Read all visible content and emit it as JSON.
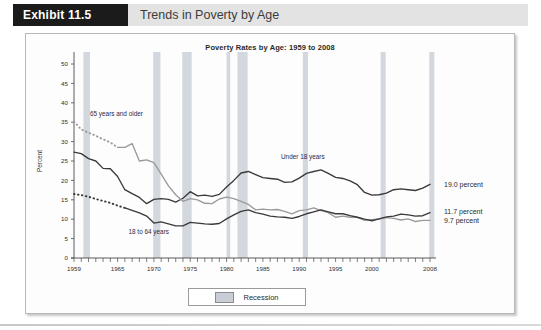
{
  "exhibit": {
    "badge": "Exhibit 11.5",
    "title": "Trends in Poverty by Age"
  },
  "legend": {
    "recession_label": "Recession",
    "swatch_name": "recession-swatch"
  },
  "annotations": {
    "under18": "Under 18 years",
    "age65": "65 years and older",
    "age18to64": "18 to 64 years",
    "value_under18": "19.0 percent",
    "value_18to64": "11.7 percent",
    "value_65plus": "9.7 percent"
  },
  "chart_data": {
    "type": "line",
    "title": "Poverty Rates by Age: 1959 to 2008",
    "xlabel": "",
    "ylabel": "Percent",
    "xlim": [
      1959,
      2008
    ],
    "ylim": [
      0,
      50
    ],
    "yticks": [
      0,
      5,
      10,
      15,
      20,
      25,
      30,
      35,
      40,
      45,
      50
    ],
    "xticks_labeled": [
      1959,
      1965,
      1970,
      1975,
      1980,
      1985,
      1990,
      1995,
      2000,
      2008
    ],
    "grid": false,
    "legend_position": "bottom-center",
    "x": [
      1959,
      1960,
      1961,
      1962,
      1963,
      1964,
      1965,
      1966,
      1967,
      1968,
      1969,
      1970,
      1971,
      1972,
      1973,
      1974,
      1975,
      1976,
      1977,
      1978,
      1979,
      1980,
      1981,
      1982,
      1983,
      1984,
      1985,
      1986,
      1987,
      1988,
      1989,
      1990,
      1991,
      1992,
      1993,
      1994,
      1995,
      1996,
      1997,
      1998,
      1999,
      2000,
      2001,
      2002,
      2003,
      2004,
      2005,
      2006,
      2007,
      2008
    ],
    "series": [
      {
        "name": "Under 18 years",
        "color": "#3a3a3a",
        "style": "solid",
        "end_value": 19.0,
        "values": [
          27.3,
          26.9,
          25.6,
          25.0,
          23.1,
          23.0,
          21.0,
          17.6,
          16.6,
          15.6,
          14.0,
          15.1,
          15.3,
          15.1,
          14.4,
          15.4,
          17.1,
          16.0,
          16.2,
          15.9,
          16.4,
          18.3,
          20.0,
          21.9,
          22.3,
          21.5,
          20.7,
          20.5,
          20.3,
          19.5,
          19.6,
          20.6,
          21.8,
          22.3,
          22.7,
          21.8,
          20.8,
          20.5,
          19.9,
          18.9,
          16.9,
          16.2,
          16.3,
          16.7,
          17.6,
          17.8,
          17.6,
          17.4,
          18.0,
          19.0
        ]
      },
      {
        "name": "65 years and older",
        "color": "#9a9a9a",
        "style": "dotted-then-solid",
        "dotted_until": 1965,
        "end_value": 9.7,
        "values": [
          35.2,
          33.1,
          32.3,
          31.5,
          30.6,
          29.8,
          28.5,
          28.5,
          29.5,
          25.0,
          25.3,
          24.6,
          21.6,
          18.6,
          16.3,
          14.6,
          15.3,
          15.0,
          14.1,
          14.0,
          15.2,
          15.7,
          15.3,
          14.6,
          13.8,
          12.4,
          12.6,
          12.4,
          12.5,
          12.0,
          11.4,
          12.2,
          12.4,
          12.9,
          12.2,
          11.7,
          10.5,
          10.8,
          10.5,
          10.5,
          9.7,
          9.9,
          10.1,
          10.4,
          10.2,
          9.8,
          10.1,
          9.4,
          9.7,
          9.7
        ]
      },
      {
        "name": "18 to 64 years",
        "color": "#3a3a3a",
        "style": "dotted-then-solid",
        "dotted_until": 1966,
        "end_value": 11.7,
        "values": [
          16.5,
          16.2,
          15.8,
          15.2,
          14.7,
          14.2,
          13.5,
          12.9,
          12.3,
          11.6,
          10.8,
          9.0,
          9.3,
          8.8,
          8.3,
          8.3,
          9.2,
          9.0,
          8.8,
          8.7,
          8.9,
          10.1,
          11.1,
          12.0,
          12.4,
          11.7,
          11.3,
          10.8,
          10.6,
          10.5,
          10.2,
          10.7,
          11.4,
          11.9,
          12.4,
          11.9,
          11.4,
          11.4,
          10.9,
          10.5,
          10.0,
          9.6,
          10.1,
          10.6,
          10.8,
          11.3,
          11.1,
          10.8,
          10.9,
          11.7
        ]
      }
    ],
    "recessions": [
      {
        "start": 1960.3,
        "end": 1961.2
      },
      {
        "start": 1969.9,
        "end": 1970.9
      },
      {
        "start": 1973.9,
        "end": 1975.2
      },
      {
        "start": 1980.0,
        "end": 1980.5
      },
      {
        "start": 1981.5,
        "end": 1982.9
      },
      {
        "start": 1990.5,
        "end": 1991.2
      },
      {
        "start": 2001.2,
        "end": 2001.9
      },
      {
        "start": 2007.9,
        "end": 2008.6
      }
    ],
    "recession_color": "#cbd0d8"
  }
}
